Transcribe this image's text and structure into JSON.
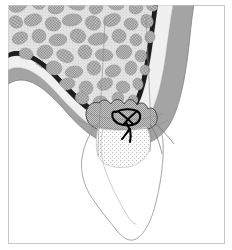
{
  "figure": {
    "domain": "medical-illustration",
    "caption": "",
    "width": 232,
    "height": 250,
    "background_color": "#ffffff",
    "frame": {
      "present": true,
      "stroke_color": "#c8c8c8",
      "stroke_width": 1,
      "x": 8,
      "y": 5,
      "width": 217,
      "height": 239
    },
    "labels": [],
    "annotations": [],
    "text_elements": [],
    "colors": {
      "cortical_bone_line": "#1a1a1a",
      "trabecular_blob": "#8f8f8f",
      "trabecular_background": "#d8d8d8",
      "marrow_space": "#e8e8e8",
      "submucosa_light": "#efefef",
      "mucosa_gray": "#a8a8a8",
      "mucosa_gray_dark": "#8a8a8a",
      "socket_clot_fill": "#b4b4b4",
      "socket_clot_stipple": "#f4f4f4",
      "suture_knot": "#000000",
      "tooth_outline": "#9a9a9a",
      "white": "#ffffff"
    },
    "structures": [
      {
        "name": "trabecular-bone",
        "label": "Trabecular (cancellous) bone",
        "texture": "checkered-dither-blobs",
        "fill": "#8f8f8f"
      },
      {
        "name": "cortical-bone",
        "label": "Cortical bone plate",
        "texture": "solid-dark-line",
        "fill": "#1a1a1a"
      },
      {
        "name": "periosteum-submucosa",
        "label": "Periosteum / submucosa",
        "texture": "light-solid",
        "fill": "#efefef"
      },
      {
        "name": "mucosa-gingiva",
        "label": "Mucosa / gingiva",
        "texture": "mid-gray-band",
        "fill": "#a8a8a8"
      },
      {
        "name": "extraction-socket-clot",
        "label": "Extraction socket with blood clot",
        "texture": "dense-checker",
        "fill": "#b4b4b4"
      },
      {
        "name": "granulation-tissue",
        "label": "Granulation tissue / healing socket",
        "texture": "sparse-stipple",
        "fill": "#f6f6f6"
      },
      {
        "name": "suture-knot",
        "label": "Surgical suture knot",
        "texture": "solid-black-loop",
        "fill": "#000000"
      },
      {
        "name": "tooth-root",
        "label": "Tooth root outline",
        "texture": "thin-outline",
        "fill": "none"
      }
    ]
  }
}
